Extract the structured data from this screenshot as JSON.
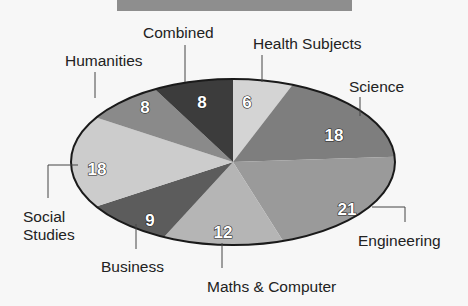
{
  "chart_data": {
    "type": "pie",
    "title": "",
    "style": "3d-flattened-ellipse",
    "start_angle_deg": 0,
    "direction": "clockwise",
    "categories": [
      "Health Subjects",
      "Science",
      "Engineering",
      "Maths & Computer",
      "Business",
      "Social Studies",
      "Humanities",
      "Combined"
    ],
    "values": [
      6,
      18,
      21,
      12,
      9,
      18,
      8,
      8
    ],
    "total": 100,
    "slices": [
      {
        "label": "Health Subjects",
        "value": 6,
        "color": "#d4d4d4",
        "label_x": 250,
        "label_y": 30,
        "label_anchor": "start",
        "leader": [
          [
            262,
            35
          ],
          [
            262,
            62
          ]
        ],
        "value_x": 255,
        "value_y": 100
      },
      {
        "label": "Science",
        "value": 18,
        "color": "#7e7e7e",
        "label_x": 348,
        "label_y": 46,
        "label_anchor": "start",
        "leader": [
          [
            358,
            51
          ],
          [
            358,
            80
          ]
        ],
        "value_x": 333,
        "value_y": 134
      },
      {
        "label": "Engineering",
        "value": 21,
        "color": "#9a9a9a",
        "label_x": 357,
        "label_y": 246,
        "label_anchor": "start",
        "leader": [
          [
            372,
            204
          ],
          [
            406,
            204
          ],
          [
            406,
            223
          ]
        ],
        "value_x": 345,
        "value_y": 208
      },
      {
        "label": "Maths & Computer",
        "value": 12,
        "color": "#b5b5b5",
        "label_x": 207,
        "label_y": 290,
        "label_anchor": "start",
        "leader": [
          [
            222,
            243
          ],
          [
            222,
            270
          ]
        ],
        "value_x": 223,
        "value_y": 232
      },
      {
        "label": "Business",
        "value": 9,
        "color": "#5c5c5c",
        "label_x": 101,
        "label_y": 274,
        "label_anchor": "start",
        "leader": [
          [
            136,
            222
          ],
          [
            136,
            252
          ]
        ],
        "value_x": 150,
        "value_y": 219
      },
      {
        "label": "Social Studies",
        "value": 18,
        "color": "#cccccc",
        "label_x": 24,
        "label_y": 220,
        "label_anchor": "start",
        "label_line2": "Studies",
        "leader": [
          [
            78,
            166
          ],
          [
            48,
            166
          ],
          [
            48,
            198
          ]
        ],
        "value_x": 98,
        "value_y": 170
      },
      {
        "label": "Humanities",
        "value": 8,
        "color": "#8a8a8a",
        "label_x": 64,
        "label_y": 71,
        "label_anchor": "start",
        "leader": [
          [
            128,
            81
          ],
          [
            128,
            106
          ]
        ],
        "value_x": 146,
        "value_y": 123
      },
      {
        "label": "Combined",
        "value": 8,
        "color": "#3c3c3c",
        "label_x": 172,
        "label_y": 40,
        "label_anchor": "start",
        "leader": [
          [
            202,
            45
          ],
          [
            202,
            80
          ]
        ],
        "value_x": 201,
        "value_y": 109
      }
    ],
    "legend": "none (leader-line labels)",
    "grid": false
  },
  "labels": {
    "health": "Health Subjects",
    "science": "Science",
    "engineering": "Engineering",
    "maths": "Maths & Computer",
    "business": "Business",
    "social_line1": "Social",
    "social_line2": "Studies",
    "humanities": "Humanities",
    "combined": "Combined"
  },
  "values": {
    "health": "6",
    "science": "18",
    "engineering": "21",
    "maths": "12",
    "business": "9",
    "social": "18",
    "humanities": "8",
    "combined": "8"
  }
}
